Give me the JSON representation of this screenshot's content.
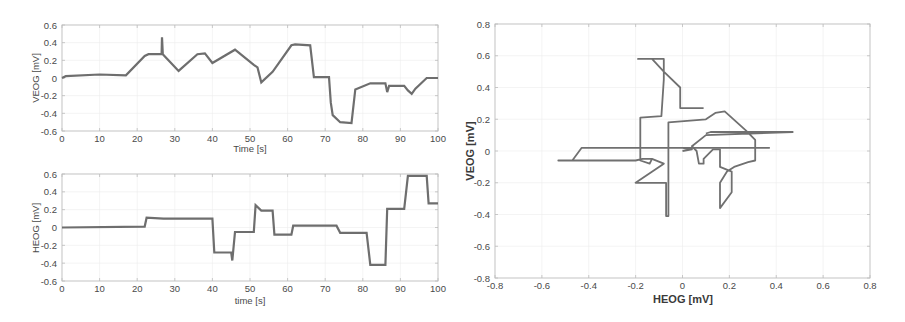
{
  "chart_data": [
    {
      "id": "veog-time",
      "type": "line",
      "title": "",
      "xlabel": "Time [s]",
      "ylabel": "VEOG [mV]",
      "xlim": [
        0,
        100
      ],
      "ylim": [
        -0.6,
        0.6
      ],
      "xticks": [
        0,
        10,
        20,
        30,
        40,
        50,
        60,
        70,
        80,
        90,
        100
      ],
      "yticks": [
        -0.6,
        -0.4,
        -0.2,
        0,
        0.2,
        0.4,
        0.6
      ],
      "grid": true,
      "legend": null,
      "series": [
        {
          "name": "VEOG",
          "x": [
            0,
            1,
            10,
            17,
            22,
            23,
            26.5,
            26.6,
            26.8,
            31,
            36,
            38,
            40,
            46,
            51,
            52,
            53,
            56,
            61,
            62,
            66,
            67,
            71,
            71.5,
            72,
            74,
            77,
            78,
            82,
            86,
            86.5,
            87,
            91,
            92,
            93,
            94,
            97,
            100
          ],
          "y": [
            0.0,
            0.02,
            0.04,
            0.03,
            0.25,
            0.27,
            0.27,
            0.46,
            0.27,
            0.08,
            0.27,
            0.28,
            0.17,
            0.32,
            0.15,
            0.12,
            -0.05,
            0.07,
            0.37,
            0.38,
            0.37,
            0.01,
            0.01,
            -0.28,
            -0.42,
            -0.5,
            -0.51,
            -0.13,
            -0.06,
            -0.06,
            -0.16,
            -0.09,
            -0.09,
            -0.14,
            -0.18,
            -0.12,
            0.0,
            0.0
          ]
        }
      ]
    },
    {
      "id": "heog-time",
      "type": "line",
      "title": "",
      "xlabel": "time [s]",
      "ylabel": "HEOG [mV]",
      "xlim": [
        0,
        100
      ],
      "ylim": [
        -0.6,
        0.6
      ],
      "xticks": [
        0,
        10,
        20,
        30,
        40,
        50,
        60,
        70,
        80,
        90,
        100
      ],
      "yticks": [
        -0.6,
        -0.4,
        -0.2,
        0,
        0.2,
        0.4,
        0.6
      ],
      "grid": true,
      "legend": null,
      "series": [
        {
          "name": "HEOG",
          "x": [
            0,
            22,
            22.5,
            27,
            40,
            40.5,
            45,
            45.3,
            46,
            51,
            51.5,
            53,
            56,
            56.5,
            61,
            61.5,
            73,
            74,
            81,
            82,
            86,
            86.5,
            91,
            92,
            97,
            97.5,
            100
          ],
          "y": [
            0.0,
            0.01,
            0.11,
            0.1,
            0.1,
            -0.28,
            -0.28,
            -0.37,
            -0.05,
            -0.05,
            0.25,
            0.19,
            0.19,
            -0.08,
            -0.08,
            0.02,
            0.02,
            -0.06,
            -0.06,
            -0.42,
            -0.42,
            0.21,
            0.21,
            0.58,
            0.58,
            0.27,
            0.27
          ]
        }
      ]
    },
    {
      "id": "heog-veog-phase",
      "type": "line",
      "title": "",
      "xlabel": "HEOG [mV]",
      "ylabel": "VEOG [mV]",
      "xlim": [
        -0.8,
        0.8
      ],
      "ylim": [
        -0.8,
        0.8
      ],
      "xticks": [
        -0.8,
        -0.6,
        -0.4,
        -0.2,
        0,
        0.2,
        0.4,
        0.6,
        0.8
      ],
      "yticks": [
        -0.8,
        -0.6,
        -0.4,
        -0.2,
        0,
        0.2,
        0.4,
        0.6,
        0.8
      ],
      "grid": true,
      "legend": null,
      "series": [
        {
          "name": "VEOG vs HEOG",
          "x": [
            0.0,
            0.04,
            0.0,
            0.37,
            0.1,
            0.05,
            -0.43,
            -0.47,
            -0.53,
            -0.2,
            -0.17,
            -0.13,
            -0.14,
            -0.18,
            -0.18,
            -0.18,
            -0.09,
            -0.08,
            -0.08,
            -0.19,
            -0.13,
            -0.08,
            -0.01,
            -0.01,
            0.09
          ],
          "y": [
            0.0,
            0.01,
            0.02,
            0.02,
            0.02,
            0.02,
            0.02,
            -0.06,
            -0.06,
            -0.06,
            -0.05,
            -0.05,
            -0.08,
            -0.06,
            0.0,
            0.21,
            0.22,
            0.45,
            0.58,
            0.58,
            0.58,
            0.5,
            0.4,
            0.27,
            0.27
          ]
        },
        {
          "name": "VEOG vs HEOG (loop)",
          "x": [
            -0.13,
            -0.08,
            -0.2,
            -0.07,
            -0.07,
            -0.06,
            -0.06,
            0.1,
            0.14,
            0.18,
            0.27,
            0.31,
            0.31,
            0.28,
            0.22,
            0.19,
            0.16,
            0.16,
            0.21,
            0.21,
            0.16,
            0.16,
            0.13,
            0.09,
            0.09,
            0.07,
            0.06,
            0.04,
            0.1,
            0.47,
            0.12,
            0.1
          ],
          "y": [
            -0.05,
            -0.08,
            -0.2,
            -0.2,
            -0.41,
            -0.41,
            0.18,
            0.2,
            0.24,
            0.25,
            0.13,
            0.07,
            -0.06,
            -0.07,
            -0.1,
            -0.13,
            -0.2,
            -0.36,
            -0.26,
            -0.13,
            -0.1,
            0.01,
            0.01,
            -0.05,
            -0.08,
            -0.08,
            0.0,
            0.03,
            0.1,
            0.12,
            0.12,
            0.11
          ]
        }
      ]
    }
  ],
  "panels": {
    "veog": {
      "ylabel": "VEOG [mV]",
      "xlabel": "Time [s]",
      "yticks": [
        "0.6",
        "0.4",
        "0.2",
        "0",
        "-0.2",
        "-0.4",
        "-0.6"
      ],
      "xticks": [
        "0",
        "10",
        "20",
        "30",
        "40",
        "50",
        "60",
        "70",
        "80",
        "90",
        "100"
      ]
    },
    "heog": {
      "ylabel": "HEOG [mV]",
      "xlabel": "time [s]",
      "yticks": [
        "0.6",
        "0.4",
        "0.2",
        "0",
        "-0.2",
        "-0.4",
        "-0.6"
      ],
      "xticks": [
        "0",
        "10",
        "20",
        "30",
        "40",
        "50",
        "60",
        "70",
        "80",
        "90",
        "100"
      ]
    },
    "phase": {
      "ylabel": "VEOG [mV]",
      "xlabel": "HEOG [mV]",
      "yticks": [
        "0.8",
        "0.6",
        "0.4",
        "0.2",
        "0",
        "-0.2",
        "-0.4",
        "-0.6",
        "-0.8"
      ],
      "xticks": [
        "-0.8",
        "-0.6",
        "-0.4",
        "-0.2",
        "0",
        "0.2",
        "0.4",
        "0.6",
        "0.8"
      ]
    }
  },
  "colors": {
    "trace": "#6e6e6e",
    "frame": "#c8c8c8",
    "grid": "#ececec",
    "text": "#4a4a4a"
  }
}
